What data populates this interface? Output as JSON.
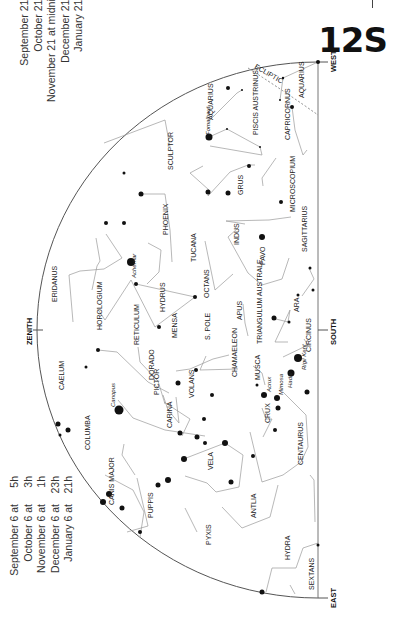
{
  "header": {
    "title": "12S"
  },
  "times_top": [
    {
      "date": "September 21 at",
      "time": "4h"
    },
    {
      "date": "October 21 at",
      "time": "2h"
    },
    {
      "date": "November 21 at",
      "time": "midnight"
    },
    {
      "date": "December 21 at",
      "time": "22h"
    },
    {
      "date": "January 21 at",
      "time": "20h"
    }
  ],
  "times_bottom": [
    {
      "date": "September 6 at",
      "time": "5h"
    },
    {
      "date": "October 6 at",
      "time": "3h"
    },
    {
      "date": "November 6 at",
      "time": "1h"
    },
    {
      "date": "December 6 at",
      "time": "23h"
    },
    {
      "date": "January 6 at",
      "time": "21h"
    }
  ],
  "directions": {
    "west": "WEST",
    "south": "SOUTH",
    "east": "EAST",
    "zenith": "ZENITH",
    "pole": "S. POLE"
  },
  "ecliptic": {
    "label": "ECLIPTIC",
    "deg1": "30°",
    "deg2": "20°",
    "deg3": "20°"
  },
  "constellations": [
    "AQUARIUS",
    "PISCIS AUSTRINUS",
    "CAPRICORNUS",
    "SCULPTOR",
    "GRUS",
    "MICROSCOPIUM",
    "PHOENIX",
    "INDUS",
    "TUCANA",
    "PAVO",
    "SAGITTARIUS",
    "ERIDANUS",
    "HOROLOGIUM",
    "HYDRUS",
    "OCTANS",
    "APUS",
    "ARA",
    "RETICULUM",
    "MENSA",
    "TRIANGULUM AUSTRALE",
    "CIRCINUS",
    "CAELUM",
    "DORADO",
    "CHAMAELEON",
    "MUSCA",
    "PICTOR",
    "VOLANS",
    "CRUX",
    "COLUMBA",
    "CARINA",
    "CENTAURUS",
    "CANIS MAJOR",
    "PUPPIS",
    "VELA",
    "ANTLIA",
    "PYXIS",
    "HYDRA",
    "SEXTANS"
  ],
  "stars": {
    "fomalhaut": "Fomalhaut",
    "achernar": "Achernar",
    "canopus": "Canopus",
    "acrux": "Acrux",
    "mimosa": "Mimosa",
    "hadar": "Hadar",
    "rigil_kent": "Rigil Kent"
  }
}
